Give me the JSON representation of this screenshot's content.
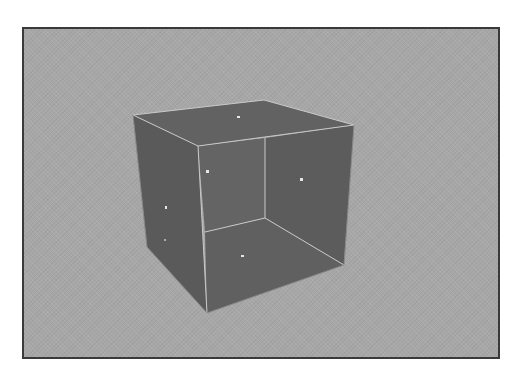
{
  "viewport": {
    "label": "3D viewport",
    "colors": {
      "background": "#a7a7a7",
      "frame": "#3a3a3a",
      "face": "#5f5f5f",
      "face_dark": "#595959",
      "face_inner": "#636363",
      "edge": "#c9c9c9",
      "vertex_dot": "#e6e6e6"
    }
  },
  "object": {
    "name": "open-cube",
    "description": "Cube mesh with front face removed, showing interior",
    "outer_vertices": {
      "top_left": [
        131,
        113
      ],
      "top_back": [
        262,
        98
      ],
      "top_right": [
        352,
        123
      ],
      "top_front": [
        196,
        144
      ],
      "bottom_left": [
        145,
        245
      ],
      "bottom_front": [
        205,
        311
      ],
      "bottom_right": [
        342,
        263
      ]
    },
    "inner_vertices": {
      "back_top": [
        263,
        136
      ],
      "back_bottom": [
        263,
        216
      ],
      "front_mid": [
        203,
        230
      ]
    },
    "face_center_dots": [
      [
        236,
        115
      ],
      [
        205,
        169
      ],
      [
        299,
        177
      ],
      [
        164,
        205
      ],
      [
        240,
        254
      ],
      [
        163,
        238
      ]
    ]
  }
}
